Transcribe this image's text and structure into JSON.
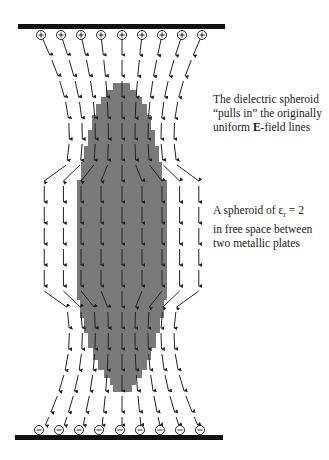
{
  "figure": {
    "type": "diagram",
    "colors": {
      "plate": "#111111",
      "spheroid": "#7a7a7a",
      "field_line": "#222222",
      "background": "#ffffff"
    },
    "top_plate": {
      "x": 18,
      "y": 24,
      "width": 207,
      "height": 5,
      "charge": "+"
    },
    "bottom_plate": {
      "x": 15,
      "y": 435,
      "width": 208,
      "height": 5,
      "charge": "−"
    },
    "charge_columns_x": [
      41,
      61,
      81,
      101,
      122,
      142,
      162,
      182,
      202
    ],
    "charge_symbols": {
      "top": "⊕",
      "bottom": "⊖"
    },
    "spheroid_steps": [
      {
        "y": 83,
        "x1": 113,
        "x2": 130
      },
      {
        "y": 90,
        "x1": 106,
        "x2": 137
      },
      {
        "y": 97,
        "x1": 101,
        "x2": 142
      },
      {
        "y": 104,
        "x1": 96,
        "x2": 147
      },
      {
        "y": 115,
        "x1": 92,
        "x2": 151
      },
      {
        "y": 130,
        "x1": 88,
        "x2": 155
      },
      {
        "y": 146,
        "x1": 84,
        "x2": 159
      },
      {
        "y": 162,
        "x1": 81,
        "x2": 162
      },
      {
        "y": 180,
        "x1": 77,
        "x2": 167
      },
      {
        "y": 300,
        "x1": 80,
        "x2": 164
      },
      {
        "y": 318,
        "x1": 84,
        "x2": 160
      },
      {
        "y": 333,
        "x1": 88,
        "x2": 156
      },
      {
        "y": 348,
        "x1": 93,
        "x2": 151
      },
      {
        "y": 360,
        "x1": 98,
        "x2": 147
      },
      {
        "y": 370,
        "x1": 104,
        "x2": 142
      },
      {
        "y": 378,
        "x1": 110,
        "x2": 136
      },
      {
        "y": 385,
        "x1": 113,
        "x2": 132
      }
    ],
    "spheroid_bottom_y": 392
  },
  "captions": {
    "caption1": {
      "line1": "The dielectric spheroid",
      "line2": "“pulls in” the originally",
      "line3_prefix": "uniform ",
      "line3_bold": "E",
      "line3_suffix": "-field lines"
    },
    "caption2": {
      "line1_prefix": "A spheroid of ε",
      "line1_sub": "r",
      "line1_suffix": " = 2",
      "line2": "in free space between",
      "line3": "two metallic plates"
    }
  }
}
